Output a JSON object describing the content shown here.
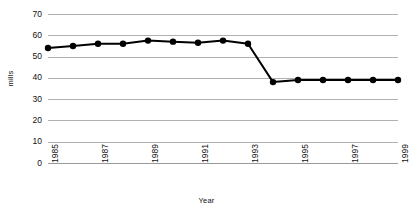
{
  "chart_data": {
    "type": "line",
    "title": "",
    "xlabel": "Year",
    "ylabel": "mills",
    "x": [
      1985,
      1986,
      1987,
      1988,
      1989,
      1990,
      1991,
      1992,
      1993,
      1994,
      1995,
      1996,
      1997,
      1998,
      1999
    ],
    "values": [
      54,
      55,
      56,
      56,
      57.5,
      57,
      56.5,
      57.5,
      56,
      38,
      39,
      39,
      39,
      39,
      39
    ],
    "series": [
      {
        "name": "mills",
        "values": [
          54,
          55,
          56,
          56,
          57.5,
          57,
          56.5,
          57.5,
          56,
          38,
          39,
          39,
          39,
          39,
          39
        ]
      }
    ],
    "xlim": [
      1985,
      1999
    ],
    "ylim": [
      0,
      70
    ],
    "yticks": [
      0,
      10,
      20,
      30,
      40,
      50,
      60,
      70
    ],
    "ytick_labels": [
      "0",
      "10",
      "20",
      "30",
      "40",
      "50",
      "60",
      "70"
    ],
    "xticks": [
      1985,
      1987,
      1989,
      1991,
      1993,
      1995,
      1997,
      1999
    ],
    "xtick_labels": [
      "1985",
      "1987",
      "1989",
      "1991",
      "1993",
      "1995",
      "1997",
      "1999"
    ],
    "xtick_rotation": -90,
    "grid": "horizontal",
    "legend": "none",
    "colors": {
      "line": "#000000",
      "marker": "#000000",
      "gridline": "#b0b0b0",
      "background": "#ffffff",
      "text": "#111111"
    },
    "line_width": 2,
    "marker_size": 3.2,
    "marker_shape": "circle"
  }
}
